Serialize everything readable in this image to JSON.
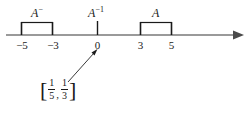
{
  "figure": {
    "type": "number-line-diagram",
    "axis": {
      "arrow_direction": "right",
      "tick_values": [
        "−5",
        "−3",
        "0",
        "3",
        "5"
      ]
    },
    "labels": {
      "negative_set": {
        "base": "A",
        "sup": "−"
      },
      "inverse_set": {
        "base": "A",
        "sup": "−1"
      },
      "positive_set": {
        "base": "A",
        "sup": ""
      }
    },
    "intervals": [
      {
        "name": "A-minus",
        "from": "−5",
        "to": "−3"
      },
      {
        "name": "A",
        "from": "3",
        "to": "5"
      }
    ],
    "annotation": {
      "open_bracket": "[",
      "first_fraction": {
        "numerator": "1",
        "denominator": "5"
      },
      "separator": ",",
      "second_fraction": {
        "numerator": "1",
        "denominator": "3"
      },
      "close_bracket": "]"
    },
    "colors": {
      "ink": "#1a1a1a",
      "axis": "#8c8c8c",
      "background": "#ffffff"
    }
  }
}
